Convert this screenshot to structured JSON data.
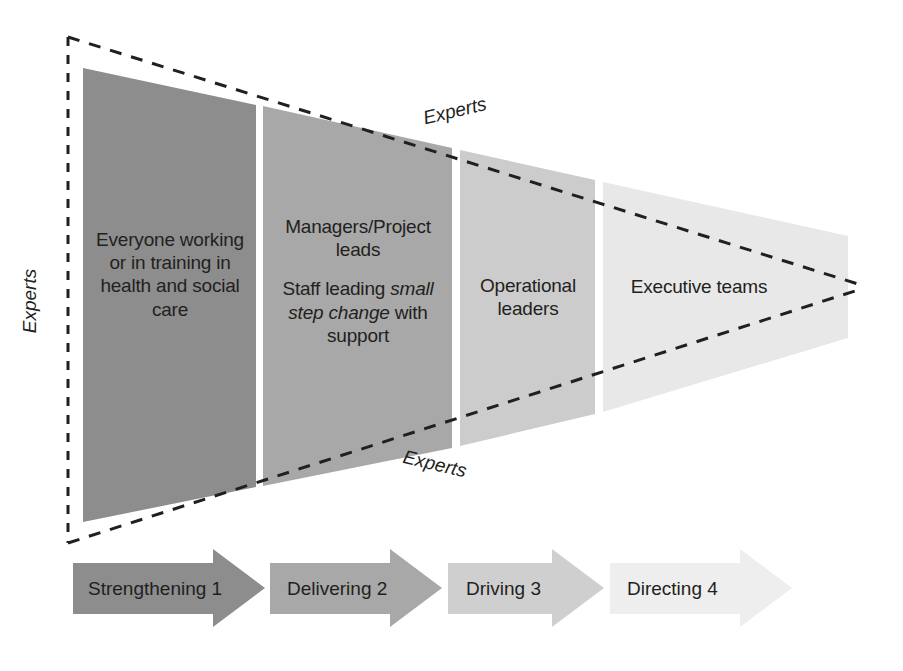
{
  "diagram": {
    "type": "funnel-triangle",
    "axis_labels": {
      "left": "Experts",
      "top": "Experts",
      "bottom": "Experts"
    },
    "segments": [
      {
        "id": "strengthening",
        "shade": "#8d8d8d",
        "lines": [
          {
            "runs": [
              {
                "text": "Everyone",
                "style": "normal"
              }
            ]
          },
          {
            "runs": [
              {
                "text": "working or in",
                "style": "normal"
              }
            ]
          },
          {
            "runs": [
              {
                "text": "training in",
                "style": "normal"
              }
            ]
          },
          {
            "runs": [
              {
                "text": "health and",
                "style": "normal"
              }
            ]
          },
          {
            "runs": [
              {
                "text": "social care",
                "style": "normal"
              }
            ]
          }
        ],
        "paragraph_1": "Everyone working or in training in health and social care",
        "paragraph_2": ""
      },
      {
        "id": "delivering",
        "shade": "#a8a8a8",
        "paragraph_1": "Managers/Project leads",
        "paragraph_2_pre": "Staff leading ",
        "paragraph_2_italic": "small step change",
        "paragraph_2_post": " with support"
      },
      {
        "id": "driving",
        "shade": "#cccccc",
        "paragraph_1": "Operational leaders",
        "paragraph_2": ""
      },
      {
        "id": "directing",
        "shade": "#e8e8e8",
        "paragraph_1": "Executive teams",
        "paragraph_2": ""
      }
    ],
    "arrows": [
      {
        "label": "Strengthening 1",
        "color": "#8d8d8d"
      },
      {
        "label": "Delivering 2",
        "color": "#a8a8a8"
      },
      {
        "label": "Driving 3",
        "color": "#cfcfcf"
      },
      {
        "label": "Directing 4",
        "color": "#eeeeee"
      }
    ],
    "colors": {
      "outline": "#231f20",
      "text": "#231f20",
      "background": "#ffffff"
    }
  }
}
